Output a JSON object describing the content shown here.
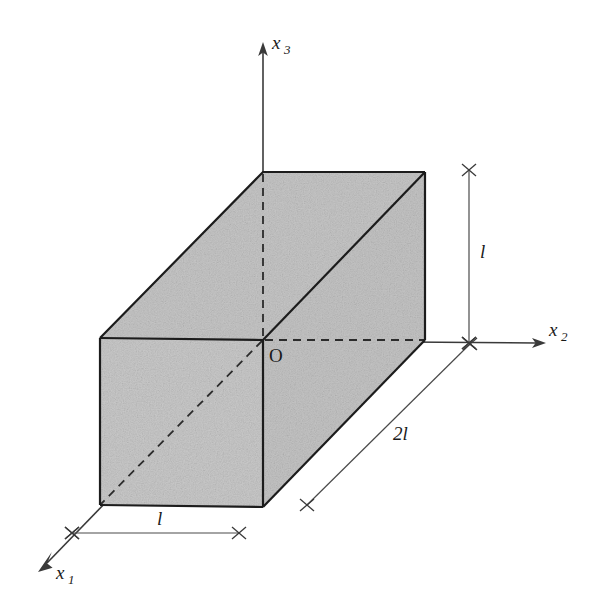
{
  "figure": {
    "background_color": "#ffffff",
    "face_fill_color": "#c8c8c8",
    "edge_color": "#1c1c1c",
    "axis_color": "#3a3a3a",
    "dimension_color": "#4a4a4a"
  },
  "axes": [
    {
      "id": "x1",
      "label_base": "x",
      "label_subscript": "1",
      "direction": "down-left",
      "arrow_tip": {
        "x": 38,
        "y": 572
      },
      "label_pos": {
        "x": 56,
        "y": 579
      },
      "has_arrow": true
    },
    {
      "id": "x2",
      "label_base": "x",
      "label_subscript": "2",
      "direction": "right",
      "arrow_tip": {
        "x": 546,
        "y": 343
      },
      "label_pos": {
        "x": 549,
        "y": 336
      },
      "has_arrow": true
    },
    {
      "id": "x3",
      "label_base": "x",
      "label_subscript": "3",
      "direction": "up",
      "arrow_tip": {
        "x": 263,
        "y": 42
      },
      "label_pos": {
        "x": 272,
        "y": 49
      },
      "has_arrow": true
    }
  ],
  "origin": {
    "label": "O",
    "point": {
      "x": 263,
      "y": 340
    },
    "label_pos": {
      "x": 269,
      "y": 362
    }
  },
  "solid": {
    "shape": "rectangular-prism",
    "origin_corner": {
      "x": 263,
      "y": 340
    },
    "width_x1": "l",
    "width_x2": "2l",
    "height_x3": "l",
    "vertices": {
      "front_top_left": {
        "x": 100,
        "y": 338
      },
      "front_top_right": {
        "x": 263,
        "y": 340
      },
      "front_bottom_left": {
        "x": 100,
        "y": 505
      },
      "front_bottom_right": {
        "x": 263,
        "y": 507
      },
      "back_top_left": {
        "x": 263,
        "y": 172
      },
      "back_top_right": {
        "x": 425,
        "y": 172
      },
      "back_bottom_right": {
        "x": 425,
        "y": 340
      },
      "right_bottom_front": {
        "x": 425,
        "y": 340
      }
    }
  },
  "dimensions": [
    {
      "id": "height-right",
      "label": "l",
      "orientation": "vertical",
      "start": {
        "x": 469,
        "y": 170
      },
      "end": {
        "x": 469,
        "y": 343
      },
      "label_pos": {
        "x": 480,
        "y": 258
      },
      "tick_style": "cross"
    },
    {
      "id": "depth-diagonal",
      "label": "2l",
      "orientation": "diagonal",
      "start": {
        "x": 307,
        "y": 505
      },
      "end": {
        "x": 470,
        "y": 344
      },
      "label_pos": {
        "x": 393,
        "y": 440
      },
      "tick_style": "cross"
    },
    {
      "id": "width-bottom",
      "label": "l",
      "orientation": "horizontal",
      "start": {
        "x": 72,
        "y": 533
      },
      "end": {
        "x": 239,
        "y": 533
      },
      "label_pos": {
        "x": 157,
        "y": 525
      },
      "tick_style": "cross"
    }
  ],
  "hidden_edges": [
    {
      "id": "vertical-dashed-back",
      "from": {
        "x": 263,
        "y": 172
      },
      "to": {
        "x": 263,
        "y": 340
      }
    },
    {
      "id": "horizontal-dashed-back",
      "from": {
        "x": 263,
        "y": 340
      },
      "to": {
        "x": 425,
        "y": 340
      }
    },
    {
      "id": "diagonal-dashed-front-face",
      "from": {
        "x": 263,
        "y": 340
      },
      "to": {
        "x": 100,
        "y": 505
      }
    }
  ]
}
